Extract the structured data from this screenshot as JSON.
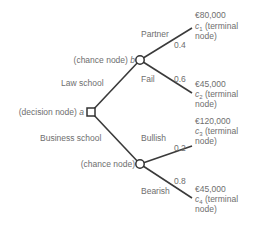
{
  "diagram": {
    "decision_node": {
      "label": "(decision node)",
      "var": "a"
    },
    "chance_nodes": [
      {
        "label": "(chance node)",
        "var": "b"
      },
      {
        "label": "(chance node)",
        "var": ""
      }
    ],
    "branches": [
      {
        "label": "Law school"
      },
      {
        "label": "Business school"
      }
    ],
    "outcomes": [
      {
        "label": "Partner",
        "prob": "0.4",
        "value": "€80,000",
        "c": "c",
        "sub": "1",
        "tail": " (terminal",
        "tail2": "node)"
      },
      {
        "label": "Fail",
        "prob": "0.6",
        "value": "€45,000",
        "c": "c",
        "sub": "2",
        "tail": " (terminal",
        "tail2": "node)"
      },
      {
        "label": "Bullish",
        "prob": "0.2",
        "value": "€120,000",
        "c": "c",
        "sub": "3",
        "tail": " (terminal",
        "tail2": "node)"
      },
      {
        "label": "Bearish",
        "prob": "0.8",
        "value": "€45,000",
        "c": "c",
        "sub": "4",
        "tail": " (terminal",
        "tail2": "node)"
      }
    ]
  }
}
